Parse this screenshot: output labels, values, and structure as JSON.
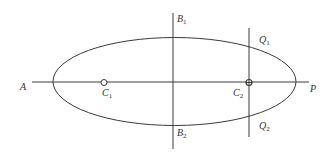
{
  "diagram": {
    "title": "",
    "labels": {
      "A": {
        "main": "A",
        "sub": ""
      },
      "P": {
        "main": "P",
        "sub": ""
      },
      "C1": {
        "main": "C",
        "sub": "1"
      },
      "C2": {
        "main": "C",
        "sub": "2"
      },
      "B1": {
        "main": "B",
        "sub": "1"
      },
      "B2": {
        "main": "B",
        "sub": "2"
      },
      "Q1": {
        "main": "Q",
        "sub": "1"
      },
      "Q2": {
        "main": "Q",
        "sub": "2"
      }
    },
    "colors": {
      "stroke": "#3a3a3a",
      "text": "#333333",
      "background": "#ffffff"
    }
  }
}
